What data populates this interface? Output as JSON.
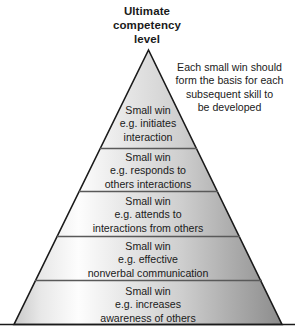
{
  "title": {
    "lines": [
      "Ultimate",
      "competency",
      "level"
    ]
  },
  "annotation": {
    "lines": [
      "Each small win should",
      "form the basis for each",
      "subsequent skill to",
      "be developed"
    ]
  },
  "pyramid": {
    "levels": [
      {
        "name": "level-1-initiates-interaction",
        "lines": [
          "Small win",
          "e.g. initiates",
          "interaction"
        ]
      },
      {
        "name": "level-2-responds-to-others",
        "lines": [
          "Small win",
          "e.g. responds to",
          "others interactions"
        ]
      },
      {
        "name": "level-3-attends-to-interactions",
        "lines": [
          "Small win",
          "e.g. attends to",
          "interactions from others"
        ]
      },
      {
        "name": "level-4-nonverbal-communication",
        "lines": [
          "Small win",
          "e.g. effective",
          "nonverbal communication"
        ]
      },
      {
        "name": "level-5-awareness-of-others",
        "lines": [
          "Small win",
          "e.g. increases",
          "awareness of others"
        ]
      }
    ]
  },
  "colors": {
    "outline": "#1a1a1a",
    "divider": "#595959",
    "text": "#1a1a1a",
    "background": "#ffffff",
    "fill_light": "#fdfdfd",
    "fill_mid": "#d8d8d8",
    "fill_dark": "#8a8a8a"
  }
}
